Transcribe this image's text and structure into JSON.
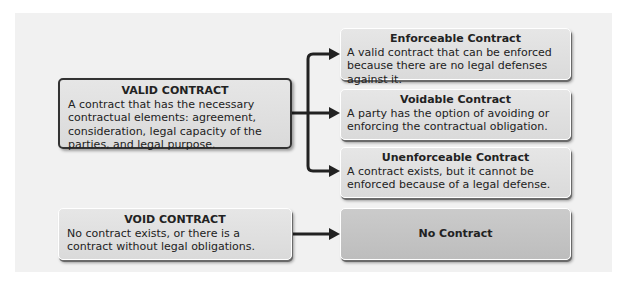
{
  "diagram": {
    "valid": {
      "title": "VALID CONTRACT",
      "body": "A contract that has the necessary contractual elements: agreement, consideration, legal capacity of the parties, and legal purpose."
    },
    "void": {
      "title": "VOID CONTRACT",
      "body": "No contract exists, or there is a contract without legal obligations."
    },
    "outcomes": [
      {
        "title": "Enforceable Contract",
        "body": "A valid contract that can be enforced because there are no legal defenses against it."
      },
      {
        "title": "Voidable Contract",
        "body": "A party has the option of avoiding or enforcing the contractual obligation."
      },
      {
        "title": "Unenforceable Contract",
        "body": "A contract exists, but it cannot be enforced because of a legal defense."
      }
    ],
    "no_contract": {
      "title": "No Contract"
    },
    "colors": {
      "panel": "#f1f1f1",
      "box": "#e0e0e0",
      "no_contract_box": "#c4c4c4",
      "connector": "#222222"
    }
  }
}
